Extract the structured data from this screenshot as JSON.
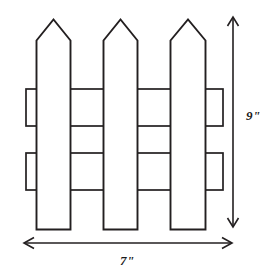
{
  "figure": {
    "name": "picket-fence-diagram",
    "stroke_color": "#231f20",
    "background_color": "#ffffff"
  },
  "dimensions": {
    "height": {
      "label": "9\"",
      "value": 9,
      "unit": "inches",
      "orientation": "vertical",
      "arrow": "double-headed",
      "position": "right"
    },
    "width": {
      "label": "7\"",
      "value": 7,
      "unit": "inches",
      "orientation": "horizontal",
      "arrow": "double-headed",
      "position": "bottom"
    }
  },
  "fence": {
    "picket_count": 3,
    "rail_count": 2,
    "pickets": [
      {
        "name": "picket-left",
        "x_left": 36,
        "x_right": 71,
        "apex_x": 53.5,
        "apex_y": 19,
        "shoulder_y": 40,
        "bottom_y": 229
      },
      {
        "name": "picket-center",
        "x_left": 103,
        "x_right": 138,
        "apex_x": 120.5,
        "apex_y": 19,
        "shoulder_y": 40,
        "bottom_y": 229
      },
      {
        "name": "picket-right",
        "x_left": 170,
        "x_right": 206,
        "apex_x": 188,
        "apex_y": 19,
        "shoulder_y": 40,
        "bottom_y": 229
      }
    ],
    "rails": [
      {
        "name": "rail-upper",
        "y_top": 89,
        "y_bottom": 126,
        "x_left": 26,
        "x_right": 223
      },
      {
        "name": "rail-lower",
        "y_top": 153,
        "y_bottom": 190,
        "x_left": 26,
        "x_right": 223
      }
    ]
  }
}
